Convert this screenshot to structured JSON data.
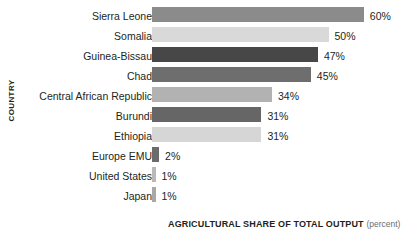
{
  "chart_data": {
    "type": "bar",
    "orientation": "horizontal",
    "title": "",
    "xlabel": "AGRICULTURAL SHARE OF TOTAL OUTPUT",
    "xlabel_unit": "(percent)",
    "ylabel": "COUNTRY",
    "grid": false,
    "legend": null,
    "xlim": [
      0,
      60
    ],
    "categories": [
      "Sierra Leone",
      "Somalia",
      "Guinea-Bissau",
      "Chad",
      "Central African Republic",
      "Burundi",
      "Ethiopia",
      "Europe EMU",
      "United States",
      "Japan"
    ],
    "values": [
      60,
      50,
      47,
      45,
      34,
      31,
      31,
      2,
      1,
      1
    ],
    "value_labels": [
      "60%",
      "50%",
      "47%",
      "45%",
      "34%",
      "31%",
      "31%",
      "2%",
      "1%",
      "1%"
    ],
    "bar_colors": [
      "#8b8b8b",
      "#d9d9d9",
      "#474747",
      "#6e6e6e",
      "#b2b2b2",
      "#666666",
      "#d6d6d6",
      "#6b6b6b",
      "#b9b9b9",
      "#a8a8a8"
    ]
  }
}
